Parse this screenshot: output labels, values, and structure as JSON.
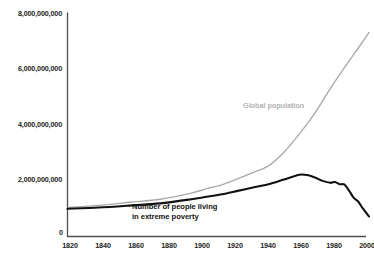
{
  "chart_data": {
    "type": "line",
    "title": "",
    "xlabel": "",
    "ylabel": "",
    "xlim": [
      1820,
      2015
    ],
    "ylim": [
      0,
      8000000000
    ],
    "grid": false,
    "legend_position": "inline-annotations",
    "x_tick_labels": [
      "1820",
      "1840",
      "1860",
      "1880",
      "1900",
      "1920",
      "1940",
      "1960",
      "1980",
      "2000"
    ],
    "x_ticks": [
      1820,
      1840,
      1860,
      1880,
      1900,
      1920,
      1940,
      1960,
      1980,
      2000
    ],
    "y_tick_labels": [
      "0",
      "2,000,000,000",
      "4,000,000,000",
      "6,000,000,000",
      "8,000,000,000"
    ],
    "y_ticks": [
      0,
      2000000000,
      4000000000,
      6000000000,
      8000000000
    ],
    "series": [
      {
        "name": "Global population",
        "color": "#a9a9a9",
        "label_text": "Global population",
        "x": [
          1820,
          1840,
          1860,
          1880,
          1900,
          1910,
          1920,
          1930,
          1940,
          1950,
          1960,
          1970,
          1980,
          1990,
          2000,
          2010,
          2015
        ],
        "values": [
          1040000000,
          1120000000,
          1230000000,
          1340000000,
          1560000000,
          1720000000,
          1860000000,
          2070000000,
          2300000000,
          2540000000,
          3030000000,
          3690000000,
          4440000000,
          5320000000,
          6140000000,
          6930000000,
          7340000000
        ]
      },
      {
        "name": "Number of people living in extreme poverty",
        "color": "#111111",
        "label_text": "Number of people living\nin extreme poverty",
        "label_line1": "Number of people living",
        "label_line2": "in extreme poverty",
        "x": [
          1820,
          1840,
          1860,
          1880,
          1900,
          1910,
          1920,
          1930,
          1940,
          1950,
          1960,
          1970,
          1975,
          1980,
          1985,
          1990,
          1993,
          1996,
          1999,
          2002,
          2005,
          2008,
          2011,
          2015
        ],
        "values": [
          1000000000,
          1040000000,
          1110000000,
          1190000000,
          1340000000,
          1430000000,
          1520000000,
          1640000000,
          1760000000,
          1880000000,
          2050000000,
          2220000000,
          2210000000,
          2120000000,
          2000000000,
          1930000000,
          1960000000,
          1880000000,
          1870000000,
          1660000000,
          1400000000,
          1260000000,
          1010000000,
          720000000
        ]
      }
    ]
  },
  "axis": {
    "y_label_8b": "8,000,000,000",
    "y_label_6b": "6,000,000,000",
    "y_label_4b": "4,000,000,000",
    "y_label_2b": "2,000,000,000",
    "y_label_0": "0",
    "x_label_1820": "1820",
    "x_label_1840": "1840",
    "x_label_1860": "1860",
    "x_label_1880": "1880",
    "x_label_1900": "1900",
    "x_label_1920": "1920",
    "x_label_1940": "1940",
    "x_label_1960": "1960",
    "x_label_1980": "1980",
    "x_label_2000": "2000"
  },
  "annotations": {
    "population_label": "Global population",
    "poverty_label_line1": "Number of people living",
    "poverty_label_line2": "in extreme poverty"
  },
  "colors": {
    "background": "#ffffff",
    "axis": "#4d4d4d",
    "population_line": "#a9a9a9",
    "poverty_line": "#111111",
    "tick_text": "#222222",
    "population_label_text": "#b3b3b3",
    "poverty_label_text": "#141414"
  }
}
